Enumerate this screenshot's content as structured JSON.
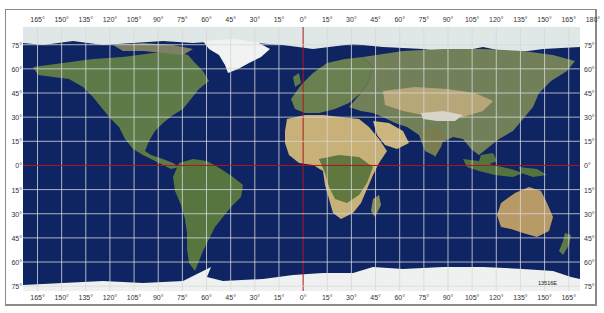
{
  "map": {
    "title": "World map with latitude/longitude grid",
    "projection": "equirectangular",
    "grid_step_degrees": 15,
    "lon_range": [
      -174,
      172
    ],
    "lat_range": [
      86,
      -78
    ],
    "plate_id": "13516E",
    "colors": {
      "ocean": "#0e2463",
      "grid": "#d8d8d8",
      "prime_meridian": "#b01818",
      "equator": "#b01818",
      "land_green": "#5f7a45",
      "land_desert": "#c9b27a",
      "ice": "#eef1f0",
      "frame": "#8a8a8a"
    },
    "top_labels": [
      "165°",
      "150°",
      "135°",
      "120°",
      "105°",
      "90°",
      "75°",
      "60°",
      "45°",
      "30°",
      "15°",
      "0°",
      "15°",
      "30°",
      "45°",
      "60°",
      "75°",
      "90°",
      "105°",
      "120°",
      "135°",
      "150°",
      "165°",
      "180°"
    ],
    "bottom_labels": [
      "165°",
      "150°",
      "135°",
      "120°",
      "105°",
      "90°",
      "75°",
      "60°",
      "45°",
      "30°",
      "15°",
      "0°",
      "15°",
      "30°",
      "45°",
      "60°",
      "75°",
      "90°",
      "105°",
      "120°",
      "135°",
      "150°",
      "165°"
    ],
    "left_labels": [
      "75°",
      "60°",
      "45°",
      "30°",
      "15°",
      "0°",
      "15°",
      "30°",
      "45°",
      "60°",
      "75°"
    ],
    "right_labels": [
      "75°",
      "60°",
      "45°",
      "30°",
      "15°",
      "0°",
      "15°",
      "30°",
      "45°",
      "60°",
      "75°"
    ]
  }
}
